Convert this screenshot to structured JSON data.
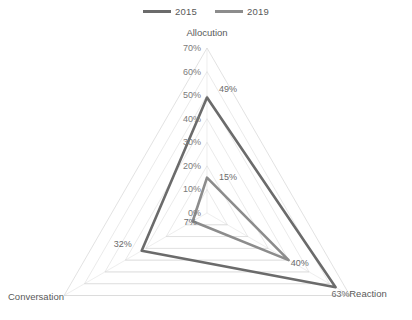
{
  "legend": {
    "position": "top-center",
    "items": [
      {
        "label": "2015",
        "color": "#6b6b6b"
      },
      {
        "label": "2019",
        "color": "#8c8c8c"
      }
    ]
  },
  "chart_data": {
    "type": "radar",
    "title": "",
    "categories": [
      "Allocution",
      "Reaction",
      "Conversation"
    ],
    "series": [
      {
        "name": "2015",
        "values": [
          49,
          63,
          32
        ],
        "color": "#6b6b6b"
      },
      {
        "name": "2019",
        "values": [
          15,
          40,
          7
        ],
        "color": "#8c8c8c"
      }
    ],
    "value_suffix": "%",
    "radial_ticks": [
      "0%",
      "10%",
      "20%",
      "30%",
      "40%",
      "50%",
      "60%",
      "70%"
    ],
    "radial_tick_values": [
      0,
      10,
      20,
      30,
      40,
      50,
      60,
      70
    ],
    "rlim": [
      0,
      70
    ],
    "grid": true,
    "grid_color": "#d9d9d9",
    "data_labels": {
      "2015": [
        "49%",
        "63%",
        "32%"
      ],
      "2019": [
        "15%",
        "40%",
        "7%"
      ]
    },
    "axis_labels": {
      "top": "Allocution",
      "bottom_right": "Reaction",
      "bottom_left": "Conversation"
    }
  },
  "geometry": {
    "center_x": 207,
    "center_y": 213,
    "radius": 165,
    "rings": 7
  }
}
